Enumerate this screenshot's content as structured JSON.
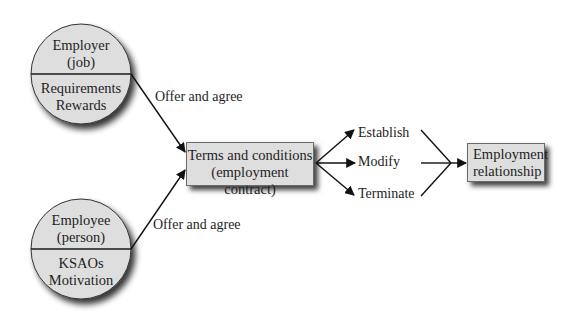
{
  "diagram": {
    "type": "flow",
    "employer_circle": {
      "top_lines": [
        "Employer",
        "(job)"
      ],
      "bottom_lines": [
        "Requirements",
        "Rewards"
      ]
    },
    "employee_circle": {
      "top_lines": [
        "Employee",
        "(person)"
      ],
      "bottom_lines": [
        "KSAOs",
        "Motivation"
      ]
    },
    "upper_edge_label": "Offer and agree",
    "lower_edge_label": "Offer and agree",
    "terms_box": {
      "line1": "Terms and conditions",
      "line2": "(employment contract)"
    },
    "actions": [
      "Establish",
      "Modify",
      "Terminate"
    ],
    "relationship_box": {
      "line1": "Employment",
      "line2": "relationship"
    },
    "colors": {
      "fill": "#dedede",
      "stroke": "#1a1a1a",
      "shadow": "#000000"
    }
  }
}
